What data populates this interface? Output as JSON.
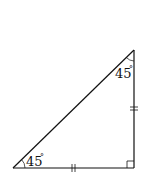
{
  "diagram": {
    "type": "right-isosceles-triangle",
    "vertices": {
      "top": [
        134,
        50
      ],
      "bottom_left": [
        13,
        168
      ],
      "bottom_right": [
        134,
        168
      ]
    },
    "angles": {
      "top": {
        "value": "45",
        "unit": "°"
      },
      "bottom_left": {
        "value": "45",
        "unit": "°"
      },
      "bottom_right": {
        "marker": "right-angle"
      }
    },
    "equal_side_marks": {
      "bottom_side": "||",
      "right_side": "||"
    },
    "colors": {
      "stroke": "#111111",
      "background": "#ffffff"
    }
  }
}
